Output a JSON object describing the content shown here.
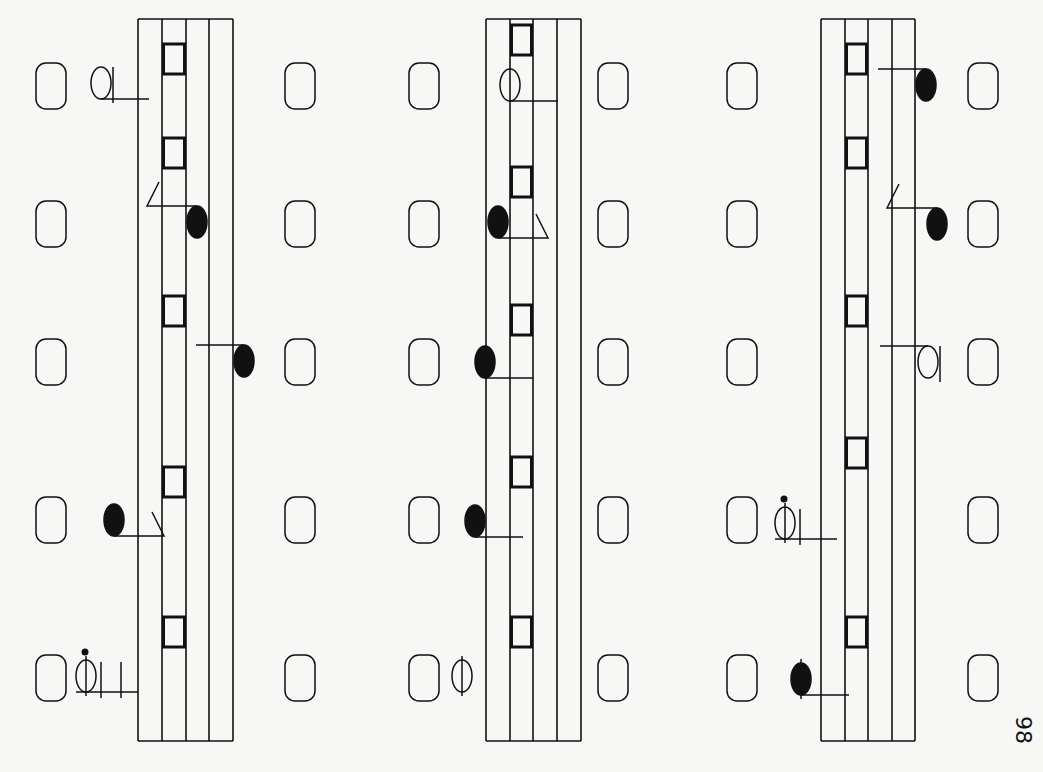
{
  "page": {
    "number": "98",
    "orientation": "rotated-90",
    "ink_color": "#111111",
    "paper_color": "#f7f7f6"
  },
  "staves": [
    {
      "name": "system-1",
      "beats": [
        {
          "rest_left": "rounded-rest",
          "rest_right": "rounded-rest",
          "note": {
            "type": "half-note",
            "side": "left",
            "stem": "right",
            "step": -3
          },
          "block": "square-mark"
        },
        {
          "rest_left": "rounded-rest",
          "rest_right": "rounded-rest",
          "note": {
            "type": "eighth-note",
            "side": "inside",
            "stem": "flag-left",
            "step": 3
          },
          "block": "square-mark"
        },
        {
          "rest_left": "rounded-rest",
          "rest_right": "rounded-rest",
          "note": {
            "type": "quarter-note",
            "side": "right",
            "stem": "left",
            "step": 7
          },
          "block": "square-mark"
        },
        {
          "rest_left": "rounded-rest",
          "rest_right": "rounded-rest",
          "note": {
            "type": "eighth-note",
            "side": "left",
            "stem": "flag-right",
            "step": -3
          },
          "block": "square-mark"
        },
        {
          "rest_left": "rounded-rest",
          "rest_right": "rounded-rest",
          "note": {
            "type": "dotted-half-note",
            "side": "left",
            "stem": "ledger",
            "step": -4
          },
          "block": "square-mark"
        }
      ]
    },
    {
      "name": "system-2",
      "beats": [
        {
          "rest_left": "rounded-rest",
          "rest_right": "rounded-rest",
          "note": {
            "type": "half-note",
            "side": "inside",
            "stem": "right",
            "step": 0
          },
          "block": "square-mark"
        },
        {
          "rest_left": "rounded-rest",
          "rest_right": "rounded-rest",
          "note": {
            "type": "eighth-note",
            "side": "inside",
            "stem": "flag-right",
            "step": 0
          },
          "block": "square-mark"
        },
        {
          "rest_left": "rounded-rest",
          "rest_right": "rounded-rest",
          "note": {
            "type": "quarter-note",
            "side": "left",
            "stem": "right",
            "step": -1
          },
          "block": "square-mark"
        },
        {
          "rest_left": "rounded-rest",
          "rest_right": "rounded-rest",
          "note": {
            "type": "quarter-note",
            "side": "left",
            "stem": "right",
            "step": -1
          },
          "block": "square-mark"
        },
        {
          "rest_left": "rounded-rest",
          "rest_right": "rounded-rest",
          "note": {
            "type": "whole-note-slashed",
            "side": "left",
            "stem": "none",
            "step": -2
          },
          "block": "square-mark"
        }
      ]
    },
    {
      "name": "system-3",
      "beats": [
        {
          "rest_left": "rounded-rest",
          "rest_right": "rounded-rest",
          "note": {
            "type": "quarter-note",
            "side": "right",
            "stem": "left",
            "step": 7
          },
          "block": "square-mark"
        },
        {
          "rest_left": "rounded-rest",
          "rest_right": "rounded-rest",
          "note": {
            "type": "eighth-note",
            "side": "right",
            "stem": "flag-left",
            "step": 7
          },
          "block": "square-mark"
        },
        {
          "rest_left": "rounded-rest",
          "rest_right": "rounded-rest",
          "note": {
            "type": "half-note",
            "side": "right",
            "stem": "left",
            "step": 6
          },
          "block": "square-mark"
        },
        {
          "rest_left": "rounded-rest",
          "rest_right": "rounded-rest",
          "note": {
            "type": "dotted-half-note",
            "side": "left",
            "stem": "ledger",
            "step": -3
          },
          "block": "square-mark"
        },
        {
          "rest_left": "rounded-rest",
          "rest_right": "rounded-rest",
          "note": {
            "type": "quarter-note-crossed",
            "side": "left",
            "stem": "right",
            "step": -3
          },
          "block": "square-mark"
        }
      ]
    }
  ]
}
